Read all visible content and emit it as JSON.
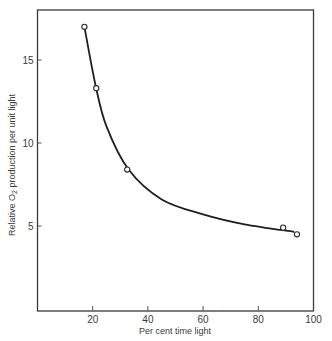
{
  "chart_data": {
    "type": "scatter",
    "title": "",
    "xlabel": "Per cent time light",
    "ylabel_prefix": "Relative O",
    "ylabel_subscript": "2",
    "ylabel_suffix": " production per unit light",
    "ylabel": "Relative O2 production per unit light",
    "xlim": [
      0,
      100
    ],
    "ylim": [
      0,
      18
    ],
    "xticks": [
      20,
      40,
      60,
      80,
      100
    ],
    "xtick_labels": [
      "20",
      "40",
      "60",
      "80",
      "100"
    ],
    "yticks": [
      5,
      10,
      15
    ],
    "ytick_labels": [
      "5",
      "10",
      "15"
    ],
    "grid": false,
    "legend": null,
    "series": [
      {
        "name": "observed",
        "marker": "open-circle",
        "x": [
          17,
          21.3,
          32.5,
          89,
          94
        ],
        "y": [
          17.0,
          13.3,
          8.4,
          4.9,
          4.5
        ]
      },
      {
        "name": "fitted-curve",
        "style": "smooth-line",
        "x": [
          17,
          21,
          25,
          33,
          45,
          60,
          75,
          93
        ],
        "y": [
          17.0,
          13.5,
          11.0,
          8.4,
          6.6,
          5.7,
          5.1,
          4.65
        ]
      }
    ]
  }
}
